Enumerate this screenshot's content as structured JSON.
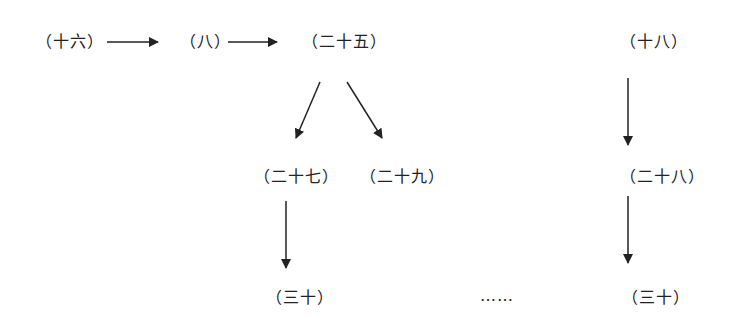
{
  "nodes": {
    "n16": "（十六）",
    "n8": "（八）",
    "n25": "（二十五）",
    "n18": "（十八）",
    "n27": "（二十七）",
    "n29": "（二十九）",
    "n28": "（二十八）",
    "n30a": "（三十）",
    "n30b": "（三十）",
    "ellipsis": "……"
  },
  "edges": [
    {
      "from": "n16",
      "to": "n8"
    },
    {
      "from": "n8",
      "to": "n25"
    },
    {
      "from": "n25",
      "to": "n27"
    },
    {
      "from": "n25",
      "to": "n29"
    },
    {
      "from": "n27",
      "to": "n30a"
    },
    {
      "from": "n18",
      "to": "n28"
    },
    {
      "from": "n28",
      "to": "n30b"
    }
  ],
  "colors": {
    "line": "#222222",
    "background": "#ffffff"
  }
}
